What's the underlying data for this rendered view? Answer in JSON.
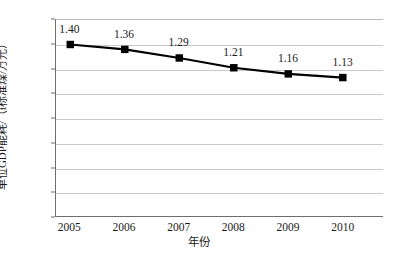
{
  "chart_data": {
    "type": "line",
    "title": "",
    "xlabel": "年份",
    "ylabel": "单位GDP能耗/（t标准煤/万元）",
    "categories": [
      "2005",
      "2006",
      "2007",
      "2008",
      "2009",
      "2010"
    ],
    "values": [
      1.4,
      1.36,
      1.29,
      1.21,
      1.16,
      1.13
    ],
    "point_labels": [
      "1.40",
      "1.36",
      "1.29",
      "1.21",
      "1.16",
      "1.13"
    ],
    "ylim": [
      0,
      1.6
    ],
    "y_ticks": [
      "1.6",
      "1.4",
      "1.2",
      "1.0",
      "0.8",
      "0.6",
      "0.4",
      "0.2",
      "0"
    ],
    "y_tick_values": [
      1.6,
      1.4,
      1.2,
      1.0,
      0.8,
      0.6,
      0.4,
      0.2,
      0
    ],
    "grid": true,
    "legend": false,
    "series_color": "#000000",
    "marker": "square",
    "gridline_color": "#c8c8c8",
    "axis_color": "#6e6e6e",
    "background": "#ffffff"
  }
}
